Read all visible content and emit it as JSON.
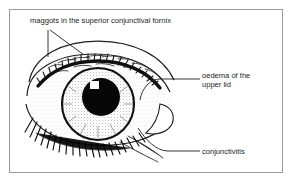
{
  "figure": {
    "type": "medical-line-drawing",
    "background_color": "#ffffff",
    "frame_color": "#9a9a9a",
    "ink_color": "#1d1d1d"
  },
  "labels": {
    "maggots": "maggots in the superior conjunctival fornix",
    "oedema_line1": "oedema of the",
    "oedema_line2": "upper lid",
    "conjunctivitis": "conjunctivitis"
  },
  "drawing_parts": {
    "upper_lid": "swollen upper eyelid",
    "lower_lid": "lower eyelid",
    "iris": "stippled iris",
    "pupil": "dark pupil",
    "highlight": "corneal light reflex",
    "upper_lashes": "upper eyelashes",
    "lower_lashes": "lower eyelashes",
    "lateral_canthus": "lateral canthus"
  }
}
